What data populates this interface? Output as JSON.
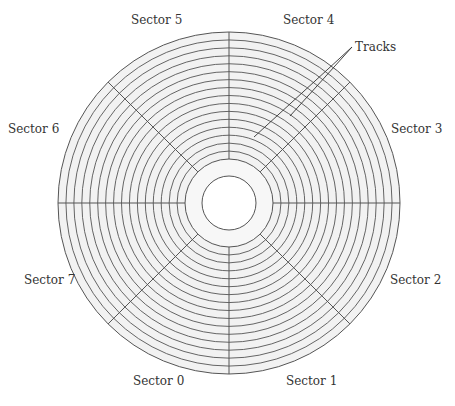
{
  "diagram": {
    "center": {
      "x": 229,
      "y": 203
    },
    "outer_radius": 171,
    "track_inner_radius": 44,
    "hub_radius": 27,
    "track_count": 16,
    "sector_count": 8,
    "colors": {
      "fill": "#f2f2f2",
      "line": "#555555",
      "hub_fill": "#ffffff"
    }
  },
  "labels": {
    "sector0": "Sector 0",
    "sector1": "Sector 1",
    "sector2": "Sector 2",
    "sector3": "Sector 3",
    "sector4": "Sector 4",
    "sector5": "Sector 5",
    "sector6": "Sector 6",
    "sector7": "Sector 7",
    "tracks": "Tracks"
  }
}
